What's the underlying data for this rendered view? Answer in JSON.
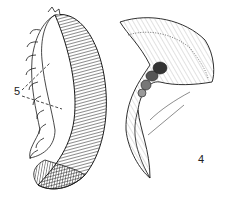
{
  "figure": {
    "labels": [
      {
        "id": "label-5",
        "text": "5",
        "x": 14,
        "y": 92
      },
      {
        "id": "label-4",
        "text": "4",
        "x": 198,
        "y": 160
      }
    ],
    "colors": {
      "ink": "#1a1a1a",
      "background": "#ffffff"
    }
  }
}
